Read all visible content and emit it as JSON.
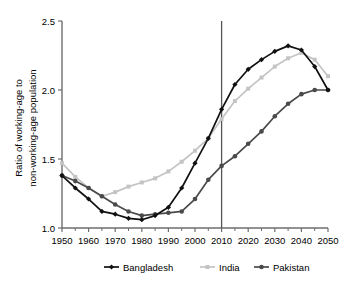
{
  "chart_data": {
    "type": "line",
    "title": "",
    "xlabel": "",
    "ylabel": "Ratio of working-age to non-working-age population",
    "ylabel_line1": "Ratio of working-age to",
    "ylabel_line2": "non-working-age population",
    "xlim": [
      1950,
      2050
    ],
    "ylim": [
      1.0,
      2.5
    ],
    "ytick_labels": [
      "1.0",
      "1.5",
      "2.0",
      "2.5"
    ],
    "ytick_values": [
      1.0,
      1.5,
      2.0,
      2.5
    ],
    "xtick_labels": [
      "1950",
      "1960",
      "1970",
      "1980",
      "1990",
      "2000",
      "2010",
      "2020",
      "2030",
      "2040",
      "2050"
    ],
    "xtick_values": [
      1950,
      1960,
      1970,
      1980,
      1990,
      2000,
      2010,
      2020,
      2030,
      2040,
      2050
    ],
    "minor_xtick_values": [
      1955,
      1965,
      1975,
      1985,
      1995,
      2005,
      2015,
      2025,
      2035,
      2045
    ],
    "grid": false,
    "legend_position": "bottom",
    "annotations": [
      {
        "name": "reference-line-2010",
        "type": "vline",
        "x": 2010,
        "label": ""
      }
    ],
    "x": [
      1950,
      1955,
      1960,
      1965,
      1970,
      1975,
      1980,
      1985,
      1990,
      1995,
      2000,
      2005,
      2010,
      2015,
      2020,
      2025,
      2030,
      2035,
      2040,
      2045,
      2050
    ],
    "series": [
      {
        "name": "Bangladesh",
        "color": "#111111",
        "marker": "diamond",
        "values": [
          1.38,
          1.29,
          1.21,
          1.12,
          1.1,
          1.07,
          1.06,
          1.09,
          1.15,
          1.29,
          1.47,
          1.65,
          1.86,
          2.04,
          2.15,
          2.22,
          2.28,
          2.32,
          2.29,
          2.17,
          2.0
        ]
      },
      {
        "name": "India",
        "color": "#c4c4c4",
        "marker": "square",
        "values": [
          1.47,
          1.37,
          1.29,
          1.23,
          1.26,
          1.3,
          1.33,
          1.36,
          1.41,
          1.48,
          1.56,
          1.65,
          1.79,
          1.92,
          2.01,
          2.09,
          2.17,
          2.23,
          2.27,
          2.22,
          2.1
        ]
      },
      {
        "name": "Pakistan",
        "color": "#4a4a4a",
        "marker": "circle",
        "values": [
          1.38,
          1.34,
          1.29,
          1.23,
          1.17,
          1.12,
          1.09,
          1.1,
          1.11,
          1.12,
          1.21,
          1.35,
          1.45,
          1.52,
          1.61,
          1.7,
          1.81,
          1.9,
          1.97,
          2.0,
          2.0
        ]
      }
    ]
  },
  "legend": {
    "items": [
      {
        "label": "Bangladesh",
        "color": "#111111",
        "marker": "diamond"
      },
      {
        "label": "India",
        "color": "#c4c4c4",
        "marker": "square"
      },
      {
        "label": "Pakistan",
        "color": "#4a4a4a",
        "marker": "circle"
      }
    ]
  }
}
